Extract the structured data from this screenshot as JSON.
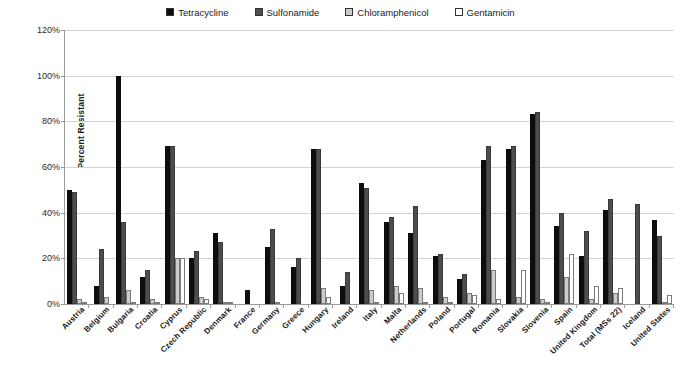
{
  "chart_data": {
    "type": "bar",
    "title": "",
    "xlabel": "",
    "ylabel": "Percent Resistant",
    "ylim": [
      0,
      120
    ],
    "ytick_labels": [
      "0%",
      "20%",
      "40%",
      "60%",
      "80%",
      "100%",
      "120%"
    ],
    "ytick_values": [
      0,
      20,
      40,
      60,
      80,
      100,
      120
    ],
    "grid": true,
    "legend_position": "top-center",
    "categories": [
      "Austria",
      "Belgium",
      "Bulgaria",
      "Croatia",
      "Cyprus",
      "Czech Republic",
      "Denmark",
      "France",
      "Germany",
      "Greece",
      "Hungary",
      "Ireland",
      "Italy",
      "Malta",
      "Netherlands",
      "Poland",
      "Portugal",
      "Romania",
      "Slovakia",
      "Slovenia",
      "Spain",
      "United Kingdom",
      "Total (MSs 22)",
      "Iceland",
      "United States"
    ],
    "series": [
      {
        "name": "Tetracycline",
        "color": "#0d0d0d",
        "values": [
          50,
          8,
          100,
          12,
          69,
          20,
          31,
          6,
          25,
          16,
          68,
          8,
          53,
          36,
          31,
          21,
          11,
          63,
          68,
          83,
          34,
          21,
          41,
          0,
          37
        ]
      },
      {
        "name": "Sulfonamide",
        "color": "#4d4d4d",
        "values": [
          49,
          24,
          36,
          15,
          69,
          23,
          27,
          0,
          33,
          20,
          68,
          14,
          51,
          38,
          43,
          22,
          13,
          69,
          69,
          84,
          40,
          32,
          46,
          44,
          30
        ]
      },
      {
        "name": "Chloramphenicol",
        "color": "#cccccc",
        "values": [
          2,
          3,
          6,
          2,
          20,
          3,
          1,
          0,
          1,
          0,
          7,
          0,
          6,
          8,
          7,
          3,
          5,
          15,
          3,
          2,
          12,
          2,
          5,
          0,
          1
        ]
      },
      {
        "name": "Gentamicin",
        "color": "#ffffff",
        "values": [
          1,
          0,
          1,
          1,
          20,
          2,
          1,
          0,
          0,
          0,
          3,
          0,
          1,
          5,
          1,
          1,
          4,
          2,
          15,
          1,
          22,
          8,
          7,
          0,
          4
        ]
      }
    ]
  }
}
